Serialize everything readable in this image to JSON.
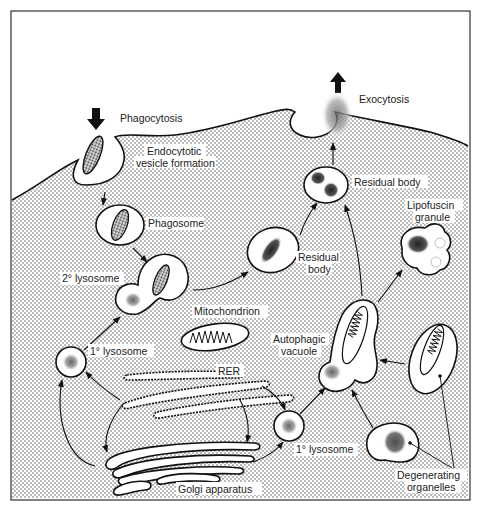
{
  "figure": {
    "colors": {
      "stroke": "#111111",
      "cytoplasm_dots": "#555555",
      "background": "#ffffff"
    }
  },
  "labels": {
    "phagocytosis": "Phagocytosis",
    "endocytotic_line1": "Endocytotic",
    "endocytotic_line2": "vesicle formation",
    "exocytosis": "Exocytosis",
    "residual_body_top": "Residual body",
    "phagosome": "Phagosome",
    "secondary_lysosome": "2° lysosome",
    "residual_body_mid_line1": "Residual",
    "residual_body_mid_line2": "body",
    "lipofuscin_line1": "Lipofuscin",
    "lipofuscin_line2": "granule",
    "mitochondrion": "Mitochondrion",
    "primary_lysosome_left": "1° lysosome",
    "autophagic_line1": "Autophagic",
    "autophagic_line2": "vacuole",
    "rer": "RER",
    "primary_lysosome_right": "1° lysosome",
    "golgi": "Golgi apparatus",
    "degenerating_line1": "Degenerating",
    "degenerating_line2": "organelles"
  }
}
